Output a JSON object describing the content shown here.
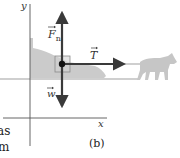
{
  "figure": {
    "panel_label": "(b)",
    "axes": {
      "x_label": "x",
      "y_label": "y"
    },
    "forces": [
      {
        "id": "normal",
        "symbol": "F",
        "subscript": "n",
        "direction": "up"
      },
      {
        "id": "tension",
        "symbol": "T",
        "subscript": "",
        "direction": "right"
      },
      {
        "id": "weight",
        "symbol": "w",
        "subscript": "",
        "direction": "down"
      }
    ],
    "objects": [
      "sled",
      "dog"
    ],
    "colors": {
      "arrow": "#3a3a3a",
      "silhouette": "#c8c8c8",
      "axis": "#555555",
      "box": "#9a9a9a"
    }
  },
  "side_text": {
    "line1": "as",
    "line2": "m"
  }
}
